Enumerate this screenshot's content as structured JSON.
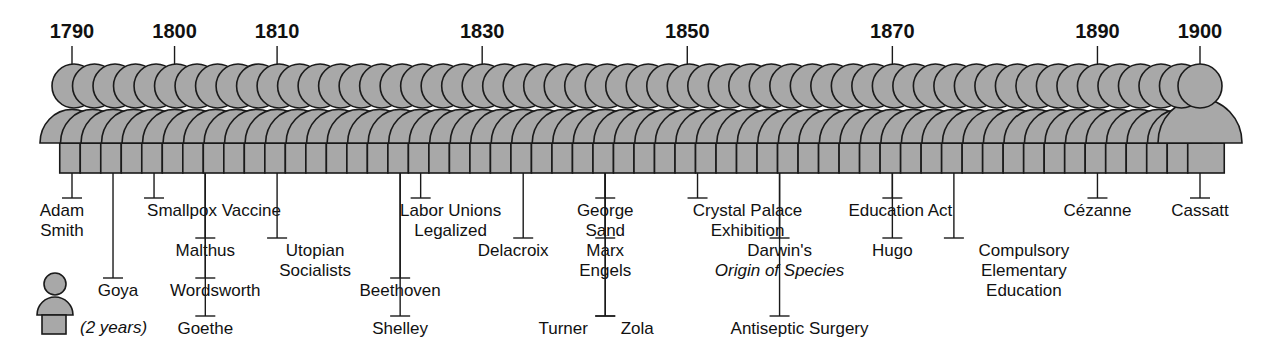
{
  "fill_color": "#a8a8a8",
  "stroke_color": "#1a1a1a",
  "start_year": 1790,
  "end_year": 1900,
  "years_per_figure": 2,
  "year_markers": [
    {
      "year": 1790,
      "label": "1790"
    },
    {
      "year": 1800,
      "label": "1800"
    },
    {
      "year": 1810,
      "label": "1810"
    },
    {
      "year": 1830,
      "label": "1830"
    },
    {
      "year": 1850,
      "label": "1850"
    },
    {
      "year": 1870,
      "label": "1870"
    },
    {
      "year": 1890,
      "label": "1890"
    },
    {
      "year": 1900,
      "label": "1900"
    }
  ],
  "legend": {
    "label": "(2 years)"
  },
  "events": [
    {
      "id": "adam-smith",
      "year": 1790,
      "lines": [
        "Adam",
        "Smith"
      ],
      "tier": 1
    },
    {
      "id": "goya",
      "year": 1794,
      "lines": [
        "Goya"
      ],
      "tier": 3
    },
    {
      "id": "smallpox-vaccine",
      "year": 1798,
      "lines": [
        "Smallpox Vaccine"
      ],
      "tier": 1
    },
    {
      "id": "malthus",
      "year": 1803,
      "lines": [
        "Malthus"
      ],
      "tier": 2
    },
    {
      "id": "wordsworth",
      "year": 1803,
      "lines": [
        "Wordsworth"
      ],
      "tier": 3
    },
    {
      "id": "goethe",
      "year": 1803,
      "lines": [
        "Goethe"
      ],
      "tier": 4
    },
    {
      "id": "utopian-socialists",
      "year": 1810,
      "lines": [
        "Utopian",
        "Socialists"
      ],
      "tier": 2
    },
    {
      "id": "labor-unions",
      "year": 1824,
      "lines": [
        "Labor Unions",
        "Legalized"
      ],
      "tier": 1
    },
    {
      "id": "beethoven",
      "year": 1822,
      "lines": [
        "Beethoven"
      ],
      "tier": 3
    },
    {
      "id": "shelley",
      "year": 1822,
      "lines": [
        "Shelley"
      ],
      "tier": 4
    },
    {
      "id": "delacroix",
      "year": 1834,
      "lines": [
        "Delacroix"
      ],
      "tier": 2
    },
    {
      "id": "george-sand",
      "year": 1842,
      "lines": [
        "George",
        "Sand"
      ],
      "tier": 1
    },
    {
      "id": "marx-engels",
      "year": 1842,
      "lines": [
        "Marx",
        "Engels"
      ],
      "tier": 2
    },
    {
      "id": "turner",
      "year": 1842,
      "lines": [
        "Turner"
      ],
      "tier": 4
    },
    {
      "id": "zola",
      "year": 1842,
      "lines": [
        "Zola"
      ],
      "tier": 4
    },
    {
      "id": "crystal-palace",
      "year": 1851,
      "lines": [
        "Crystal Palace",
        "Exhibition"
      ],
      "tier": 1
    },
    {
      "id": "darwin",
      "year": 1859,
      "lines": [
        "Darwin's",
        "Origin of Species"
      ],
      "tier": 2
    },
    {
      "id": "antiseptic-surgery",
      "year": 1859,
      "lines": [
        "Antiseptic  Surgery"
      ],
      "tier": 4
    },
    {
      "id": "education-act",
      "year": 1870,
      "lines": [
        "Education Act"
      ],
      "tier": 1
    },
    {
      "id": "hugo",
      "year": 1870,
      "lines": [
        "Hugo"
      ],
      "tier": 2
    },
    {
      "id": "compulsory-education",
      "year": 1876,
      "lines": [
        "Compulsory",
        "Elementary",
        "Education"
      ],
      "tier": 2
    },
    {
      "id": "cezanne",
      "year": 1890,
      "lines": [
        "Cézanne"
      ],
      "tier": 1
    },
    {
      "id": "cassatt",
      "year": 1900,
      "lines": [
        "Cassatt"
      ],
      "tier": 1
    }
  ]
}
